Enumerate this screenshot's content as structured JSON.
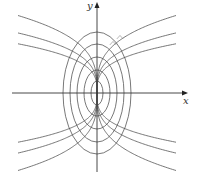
{
  "figure": {
    "axes": {
      "x_label": "x",
      "y_label": "y",
      "origin_px": [
        97,
        93
      ],
      "x_range_px": [
        12,
        188
      ],
      "y_range_px": [
        3,
        172
      ]
    },
    "ellipses": {
      "semi_axes_px": [
        {
          "a": 34,
          "b": 61
        },
        {
          "a": 27,
          "b": 49
        },
        {
          "a": 20,
          "b": 36
        },
        {
          "a": 13,
          "b": 23
        },
        {
          "a": 6,
          "b": 12
        }
      ]
    },
    "trajectories": {
      "exponent": 0.31,
      "coefficients": [
        20,
        15.5,
        12.7
      ],
      "x_extent_px": 79
    },
    "right_angle_markers": [
      {
        "x": 113,
        "y": 44
      },
      {
        "x": 120,
        "y": 38
      }
    ],
    "colors": {
      "stroke": "#555555",
      "axis": "#333333",
      "background": "#ffffff"
    }
  }
}
